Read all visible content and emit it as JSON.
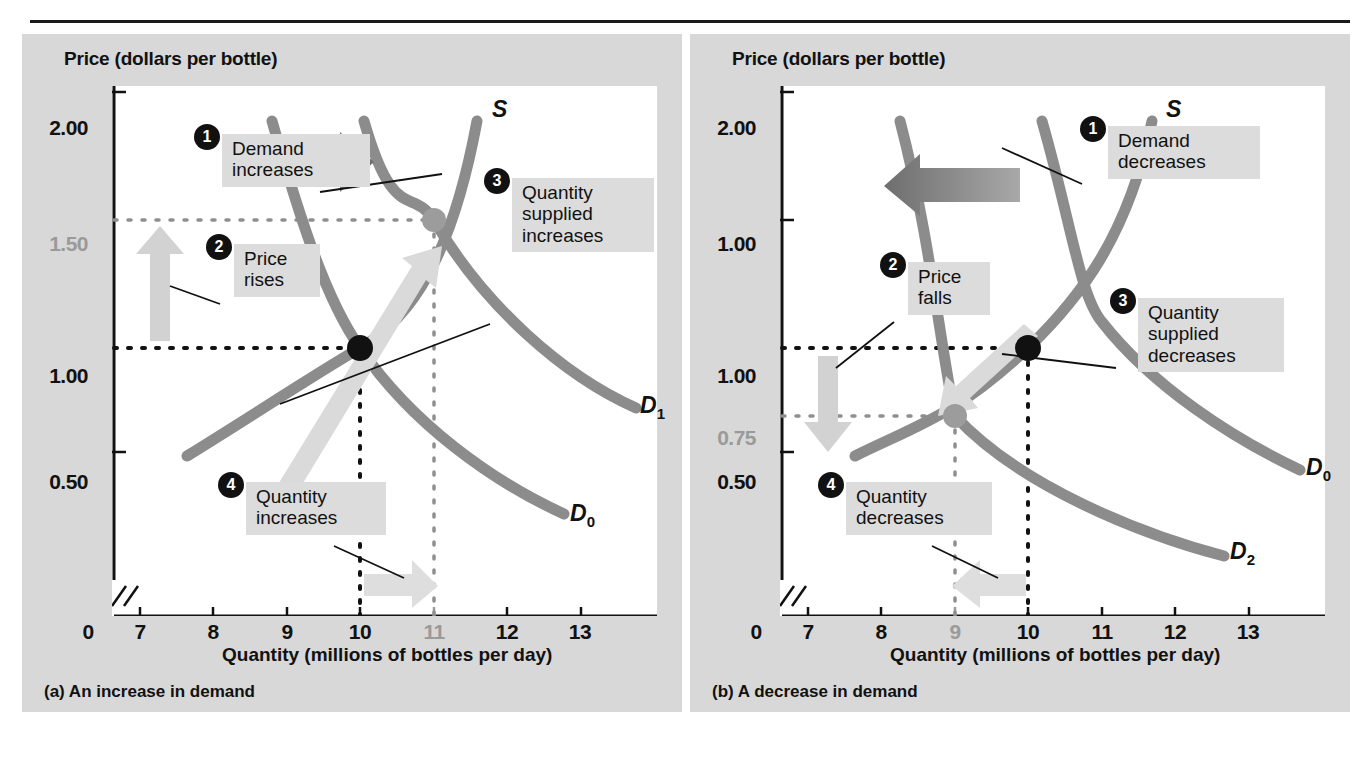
{
  "figure": {
    "type": "economics-supply-demand-diagram",
    "panels": [
      {
        "id": "a",
        "caption": "(a)  An increase in demand",
        "y_axis_title": "Price (dollars per bottle)",
        "x_axis_title": "Quantity (millions of bottles per day)",
        "y_ticks": [
          {
            "label": "2.00",
            "grey": false
          },
          {
            "label": "1.50",
            "grey": true
          },
          {
            "label": "1.00",
            "grey": false
          },
          {
            "label": "0.50",
            "grey": false
          }
        ],
        "x_ticks": [
          {
            "label": "0",
            "grey": false
          },
          {
            "label": "7",
            "grey": false
          },
          {
            "label": "8",
            "grey": false
          },
          {
            "label": "9",
            "grey": false
          },
          {
            "label": "10",
            "grey": false
          },
          {
            "label": "11",
            "grey": true
          },
          {
            "label": "12",
            "grey": false
          },
          {
            "label": "13",
            "grey": false
          }
        ],
        "curve_labels": [
          "S",
          "D₀",
          "D₁"
        ],
        "callouts": [
          {
            "number": "1",
            "text": "Demand\nincreases"
          },
          {
            "number": "2",
            "text": "Price\nrises"
          },
          {
            "number": "3",
            "text": "Quantity\nsupplied\nincreases"
          },
          {
            "number": "4",
            "text": "Quantity\nincreases"
          }
        ]
      },
      {
        "id": "b",
        "caption": "(b)  A decrease in demand",
        "y_axis_title": "Price (dollars per bottle)",
        "x_axis_title": "Quantity (millions of bottles per day)",
        "y_ticks": [
          {
            "label": "2.00",
            "grey": false
          },
          {
            "label": "1.00",
            "grey": false
          },
          {
            "label": "1.00",
            "grey": false
          },
          {
            "label": "0.75",
            "grey": true
          },
          {
            "label": "0.50",
            "grey": false
          }
        ],
        "x_ticks": [
          {
            "label": "0",
            "grey": false
          },
          {
            "label": "7",
            "grey": false
          },
          {
            "label": "8",
            "grey": false
          },
          {
            "label": "9",
            "grey": true
          },
          {
            "label": "10",
            "grey": false
          },
          {
            "label": "11",
            "grey": false
          },
          {
            "label": "12",
            "grey": false
          },
          {
            "label": "13",
            "grey": false
          }
        ],
        "curve_labels": [
          "S",
          "D₀",
          "D₂"
        ],
        "callouts": [
          {
            "number": "1",
            "text": "Demand\ndecreases"
          },
          {
            "number": "2",
            "text": "Price\nfalls"
          },
          {
            "number": "3",
            "text": "Quantity\nsupplied\ndecreases"
          },
          {
            "number": "4",
            "text": "Quantity\ndecreases"
          }
        ]
      }
    ]
  },
  "chart_data": [
    {
      "type": "line",
      "title": "(a) An increase in demand",
      "xlabel": "Quantity (millions of bottles per day)",
      "ylabel": "Price (dollars per bottle)",
      "xlim": [
        7,
        13
      ],
      "ylim": [
        0,
        2.25
      ],
      "xticks": [
        0,
        7,
        8,
        9,
        10,
        11,
        12,
        13
      ],
      "yticks": [
        0.5,
        1.0,
        1.5,
        2.0
      ],
      "grid": false,
      "legend": "inline-curve-labels",
      "series": [
        {
          "name": "S",
          "kind": "supply",
          "points": [
            [
              7.7,
              0.45
            ],
            [
              8.6,
              0.8
            ],
            [
              9.4,
              1.15
            ],
            [
              10.0,
              1.42
            ],
            [
              10.6,
              1.7
            ],
            [
              11.1,
              2.05
            ]
          ]
        },
        {
          "name": "D₀",
          "kind": "demand-initial",
          "points": [
            [
              8.4,
              2.05
            ],
            [
              9.0,
              1.55
            ],
            [
              10.0,
              1.0
            ],
            [
              11.0,
              0.73
            ],
            [
              12.0,
              0.52
            ]
          ]
        },
        {
          "name": "D₁",
          "kind": "demand-new",
          "points": [
            [
              9.5,
              2.05
            ],
            [
              10.1,
              1.55
            ],
            [
              11.0,
              1.1
            ],
            [
              12.0,
              0.85
            ],
            [
              12.9,
              0.7
            ]
          ]
        }
      ],
      "equilibria": [
        {
          "label": "initial",
          "x": 10,
          "y": 1.0,
          "marker": "filled-black"
        },
        {
          "label": "new",
          "x": 11,
          "y": 1.5,
          "marker": "filled-grey"
        }
      ],
      "annotations": [
        {
          "number": "1",
          "text": "Demand increases",
          "arrow": "right",
          "target": "demand-shift"
        },
        {
          "number": "2",
          "text": "Price rises",
          "arrow": "up",
          "target": "price-axis 1.00 to 1.50"
        },
        {
          "number": "3",
          "text": "Quantity supplied increases",
          "arrow": "up-right",
          "target": "along-supply-curve"
        },
        {
          "number": "4",
          "text": "Quantity increases",
          "arrow": "right",
          "target": "quantity-axis 10 to 11"
        }
      ]
    },
    {
      "type": "line",
      "title": "(b) A decrease in demand",
      "xlabel": "Quantity (millions of bottles per day)",
      "ylabel": "Price (dollars per bottle)",
      "xlim": [
        7,
        13
      ],
      "ylim": [
        0,
        2.25
      ],
      "xticks": [
        0,
        7,
        8,
        9,
        10,
        11,
        12,
        13
      ],
      "yticks": [
        0.5,
        0.75,
        1.0,
        2.0
      ],
      "grid": false,
      "legend": "inline-curve-labels",
      "series": [
        {
          "name": "S",
          "kind": "supply",
          "points": [
            [
              7.7,
              0.45
            ],
            [
              8.6,
              0.8
            ],
            [
              9.4,
              1.15
            ],
            [
              10.0,
              1.42
            ],
            [
              10.6,
              1.7
            ],
            [
              11.1,
              2.05
            ]
          ]
        },
        {
          "name": "D₀",
          "kind": "demand-initial",
          "points": [
            [
              9.5,
              2.05
            ],
            [
              10.1,
              1.55
            ],
            [
              11.0,
              1.1
            ],
            [
              12.0,
              0.85
            ],
            [
              12.9,
              0.62
            ]
          ]
        },
        {
          "name": "D₂",
          "kind": "demand-new",
          "points": [
            [
              8.4,
              2.05
            ],
            [
              9.0,
              1.55
            ],
            [
              10.0,
              1.0
            ],
            [
              11.0,
              0.73
            ],
            [
              12.0,
              0.45
            ]
          ]
        }
      ],
      "equilibria": [
        {
          "label": "initial",
          "x": 10,
          "y": 1.0,
          "marker": "filled-black"
        },
        {
          "label": "new",
          "x": 9,
          "y": 0.75,
          "marker": "filled-grey"
        }
      ],
      "annotations": [
        {
          "number": "1",
          "text": "Demand decreases",
          "arrow": "left",
          "target": "demand-shift"
        },
        {
          "number": "2",
          "text": "Price falls",
          "arrow": "down",
          "target": "price-axis 1.00 to 0.75"
        },
        {
          "number": "3",
          "text": "Quantity supplied decreases",
          "arrow": "down-left",
          "target": "along-supply-curve"
        },
        {
          "number": "4",
          "text": "Quantity decreases",
          "arrow": "left",
          "target": "quantity-axis 10 to 9"
        }
      ]
    }
  ],
  "colors": {
    "panel_background": "#d8d8d8",
    "plot_background": "#ffffff",
    "curve": "#8c8c8c",
    "axis": "#111111",
    "callout_box": "#dcdcdc",
    "bullet": "#111111",
    "highlight_text": "#9a9a9a",
    "arrow_dark": "#8c8c8c",
    "arrow_light": "#d2d2d2"
  }
}
